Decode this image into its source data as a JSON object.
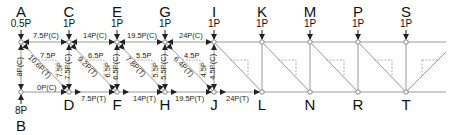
{
  "diagram": {
    "type": "truss",
    "colors": {
      "member": "#9a9a9a",
      "loaded_member": "#555555",
      "dashed": "#999999",
      "text": "#111111"
    },
    "top_chord_y": 42,
    "bottom_chord_y": 92,
    "nodes": [
      {
        "id": "A",
        "label": "A",
        "x": 21,
        "y": 42,
        "load": "0.5P"
      },
      {
        "id": "C",
        "label": "C",
        "x": 69,
        "y": 42,
        "load": "1P"
      },
      {
        "id": "E",
        "label": "E",
        "x": 117,
        "y": 42,
        "load": "1P"
      },
      {
        "id": "G",
        "label": "G",
        "x": 165,
        "y": 42,
        "load": "1P"
      },
      {
        "id": "I",
        "label": "I",
        "x": 214,
        "y": 42,
        "load": "1P"
      },
      {
        "id": "K",
        "label": "K",
        "x": 262,
        "y": 42,
        "load": "1P"
      },
      {
        "id": "M",
        "label": "M",
        "x": 310,
        "y": 42,
        "load": "1P"
      },
      {
        "id": "P",
        "label": "P",
        "x": 358,
        "y": 42,
        "load": "1P"
      },
      {
        "id": "S",
        "label": "S",
        "x": 406,
        "y": 42,
        "load": "1P"
      },
      {
        "id": "B",
        "label": "B",
        "x": 21,
        "y": 92,
        "reaction": "8P"
      },
      {
        "id": "D",
        "label": "D",
        "x": 69,
        "y": 92
      },
      {
        "id": "F",
        "label": "F",
        "x": 117,
        "y": 92
      },
      {
        "id": "H",
        "label": "H",
        "x": 165,
        "y": 92
      },
      {
        "id": "J",
        "label": "J",
        "x": 214,
        "y": 92
      },
      {
        "id": "L",
        "label": "L",
        "x": 262,
        "y": 92
      },
      {
        "id": "N",
        "label": "N",
        "x": 310,
        "y": 92
      },
      {
        "id": "R",
        "label": "R",
        "x": 358,
        "y": 92
      },
      {
        "id": "T",
        "label": "T",
        "x": 406,
        "y": 92
      }
    ],
    "member_forces": [
      {
        "member": "AC",
        "label": "7.5P(C)"
      },
      {
        "member": "CE",
        "label": "14P(C)"
      },
      {
        "member": "EG",
        "label": "19.5P(C)"
      },
      {
        "member": "GI",
        "label": "24P(C)"
      },
      {
        "member": "AB",
        "label": "8P(C)"
      },
      {
        "member": "CD",
        "label": "7.5P(C)"
      },
      {
        "member": "EF",
        "label": "6.5P(C)"
      },
      {
        "member": "GH",
        "label": "5.5P(C)"
      },
      {
        "member": "IJ",
        "label": "4.5P(C)"
      },
      {
        "member": "AD",
        "label": "10.6P(T)"
      },
      {
        "member": "CF",
        "label": "9.2P(T)"
      },
      {
        "member": "EH",
        "label": "7.8P(T)"
      },
      {
        "member": "GJ",
        "label": "6.4P(T)"
      },
      {
        "member": "BD",
        "label": "0P(C)"
      },
      {
        "member": "DF",
        "label": "7.5P(T)"
      },
      {
        "member": "FH",
        "label": "14P(T)"
      },
      {
        "member": "HJ",
        "label": "19.5P(T)"
      },
      {
        "member": "JL",
        "label": "24P(T)"
      }
    ],
    "component_triangles": [
      {
        "panel": "AD",
        "horizontal": "7.5P",
        "vertical": "7.5P"
      },
      {
        "panel": "CF",
        "horizontal": "6.5P",
        "vertical": "6.5P"
      },
      {
        "panel": "EH",
        "horizontal": "5.5P",
        "vertical": "5.5P"
      },
      {
        "panel": "GJ",
        "horizontal": "4.5P",
        "vertical": "4.5P"
      }
    ]
  }
}
